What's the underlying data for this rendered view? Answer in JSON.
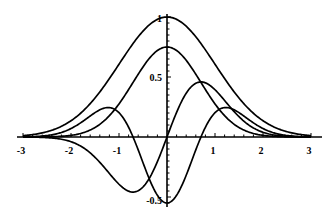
{
  "chart_data": {
    "type": "line",
    "title": "",
    "xlabel": "",
    "ylabel": "",
    "xlim": [
      -3,
      3
    ],
    "ylim": [
      -0.55,
      1.0
    ],
    "grid": false,
    "legend": null,
    "x_ticks": [
      -3,
      -2,
      -1,
      1,
      2,
      3
    ],
    "x_tick_labels": [
      "-3",
      "-2",
      "-1",
      "1",
      "2",
      "3"
    ],
    "y_ticks": [
      1,
      0.5,
      -0.5
    ],
    "y_tick_labels": [
      "1",
      "0.5",
      "-0.5"
    ],
    "series": [
      {
        "name": "gaussian_wide",
        "formula": "exp(-x^2/2)",
        "peak": [
          0,
          1.0
        ]
      },
      {
        "name": "gaussian_narrow",
        "formula": "0.75*exp(-x^2)",
        "peak": [
          0,
          0.75
        ]
      },
      {
        "name": "odd_derivative",
        "formula": "1.07*x*exp(-x^2)",
        "extrema": [
          [
            -0.71,
            -0.46
          ],
          [
            0.71,
            0.46
          ]
        ]
      },
      {
        "name": "even_second_derivative",
        "formula": "0.55*(2x^2-1)*exp(-x^2)",
        "extrema": [
          [
            -1.22,
            0.25
          ],
          [
            0,
            -0.55
          ],
          [
            1.22,
            0.25
          ]
        ]
      }
    ],
    "sample_points": {
      "x": [
        -3,
        -2.5,
        -2,
        -1.5,
        -1,
        -0.5,
        0,
        0.5,
        1,
        1.5,
        2,
        2.5,
        3
      ],
      "gaussian_wide": [
        0.011,
        0.044,
        0.135,
        0.325,
        0.607,
        0.882,
        1.0,
        0.882,
        0.607,
        0.325,
        0.135,
        0.044,
        0.011
      ],
      "gaussian_narrow": [
        0.0001,
        0.0014,
        0.0137,
        0.079,
        0.276,
        0.584,
        0.75,
        0.584,
        0.276,
        0.079,
        0.0137,
        0.0014,
        0.0001
      ],
      "odd_derivative": [
        -0.0004,
        -0.005,
        -0.039,
        -0.169,
        -0.394,
        -0.417,
        0,
        0.417,
        0.394,
        0.169,
        0.039,
        0.005,
        0.0004
      ],
      "even_second_derivative": [
        0.0012,
        0.011,
        0.071,
        0.242,
        0.202,
        -0.214,
        -0.55,
        -0.214,
        0.202,
        0.242,
        0.071,
        0.011,
        0.0012
      ]
    }
  },
  "layout": {
    "origin_px": [
      167,
      137
    ],
    "x_unit_px": 48,
    "y_unit_px": 120,
    "x_axis_range_px": [
      17,
      322
    ],
    "y_axis_range_px": [
      14,
      207
    ]
  }
}
